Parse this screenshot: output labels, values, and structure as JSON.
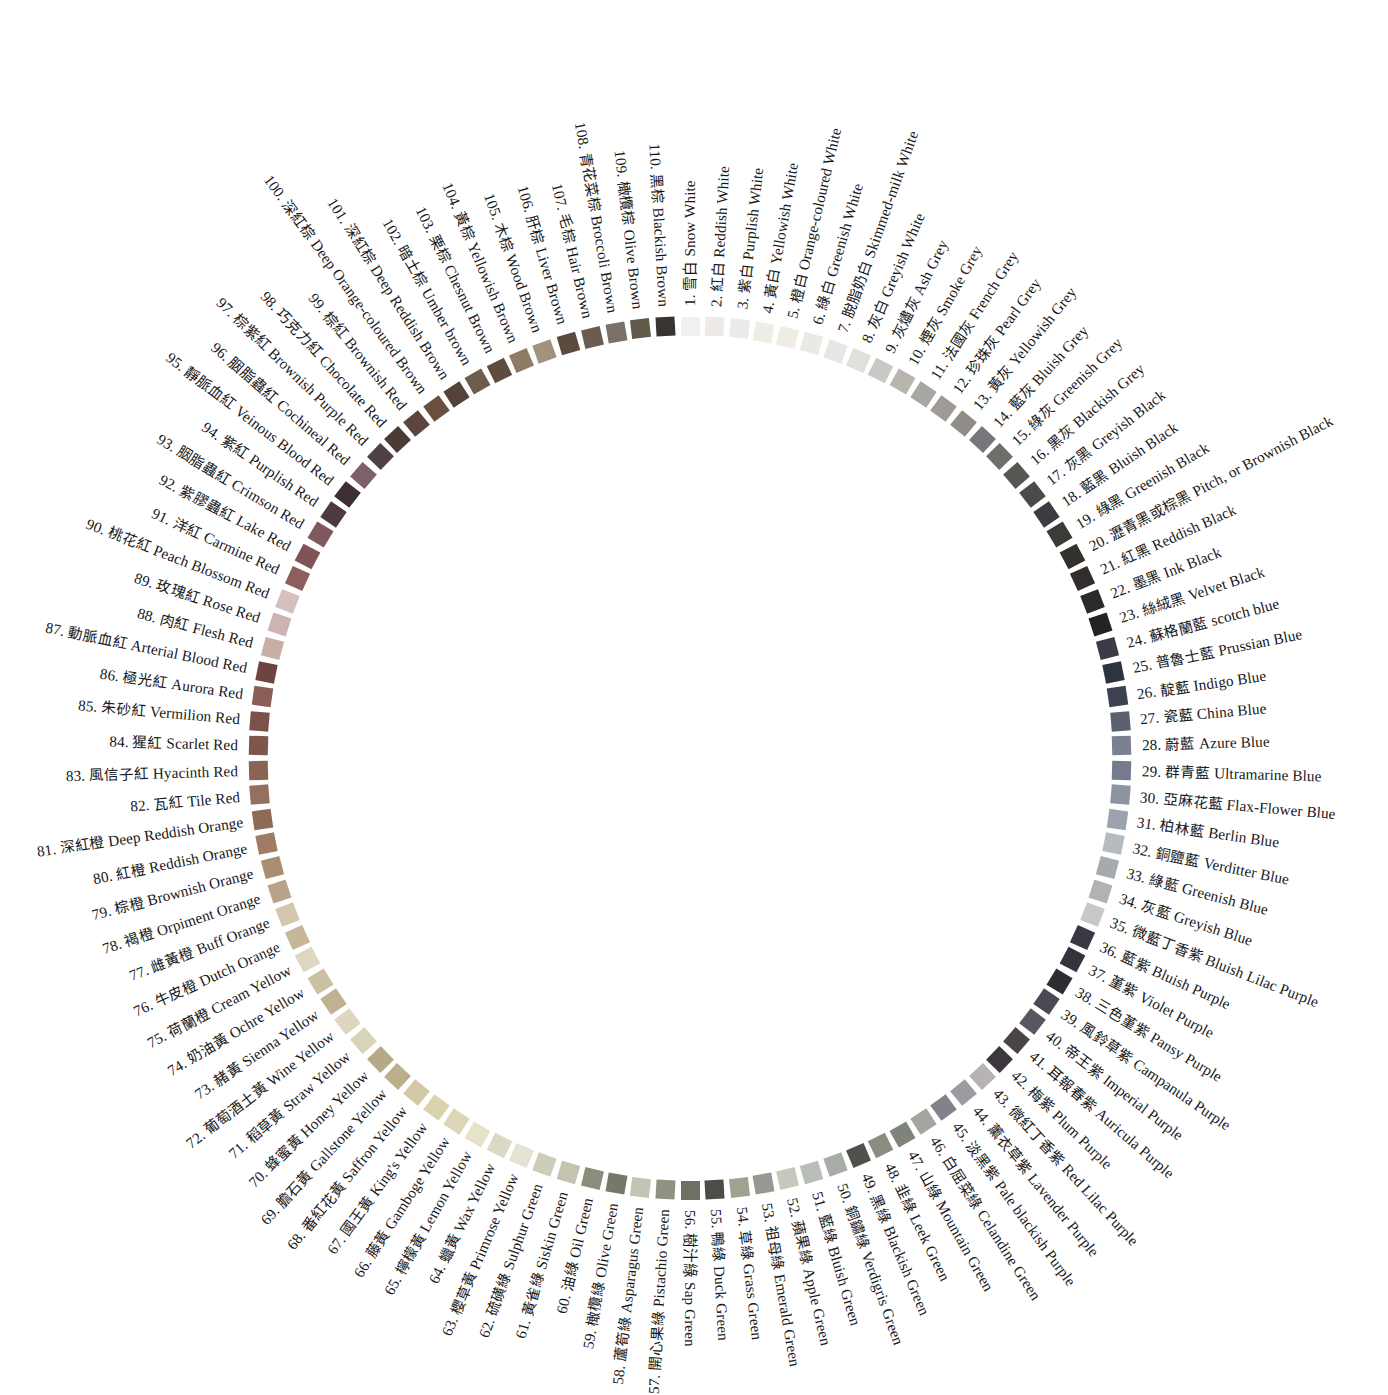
{
  "figure": {
    "swatch_count": 110,
    "center": {
      "x": 690,
      "y": 758
    },
    "swatch_radius": 432,
    "label_radius": 452,
    "start_angle_deg": -90,
    "angle_step_deg": 3.2727,
    "background": "#ffffff",
    "text_color": "#18181a"
  },
  "entries": [
    {
      "n": "1.",
      "cn": "雪白",
      "en": "Snow White",
      "hex": "#f2f1ef"
    },
    {
      "n": "2.",
      "cn": "紅白",
      "en": "Reddish White",
      "hex": "#eeeae8"
    },
    {
      "n": "3.",
      "cn": "紫白",
      "en": "Purplish White",
      "hex": "#eceaea"
    },
    {
      "n": "4.",
      "cn": "黃白",
      "en": "Yellowish White",
      "hex": "#efeee6"
    },
    {
      "n": "5.",
      "cn": "橙白",
      "en": "Orange-coloured White",
      "hex": "#efece4"
    },
    {
      "n": "6.",
      "cn": "綠白",
      "en": "Greenish White",
      "hex": "#eaeae4"
    },
    {
      "n": "7.",
      "cn": "脫脂奶白",
      "en": "Skimmed-milk White",
      "hex": "#e7e7e3"
    },
    {
      "n": "8.",
      "cn": "灰白",
      "en": "Greyish White",
      "hex": "#e0dfda"
    },
    {
      "n": "9.",
      "cn": "灰燼灰",
      "en": "Ash Grey",
      "hex": "#c9c8c4"
    },
    {
      "n": "10.",
      "cn": "煙灰",
      "en": "Smoke Grey",
      "hex": "#b7b5ae"
    },
    {
      "n": "11.",
      "cn": "法國灰",
      "en": "French Grey",
      "hex": "#a9a7a3"
    },
    {
      "n": "12.",
      "cn": "珍珠灰",
      "en": "Pearl Grey",
      "hex": "#9d9a98"
    },
    {
      "n": "13.",
      "cn": "黃灰",
      "en": "Yellowish Grey",
      "hex": "#908d86"
    },
    {
      "n": "14.",
      "cn": "藍灰",
      "en": "Bluish Grey",
      "hex": "#77767a"
    },
    {
      "n": "15.",
      "cn": "綠灰",
      "en": "Greenish Grey",
      "hex": "#6e6f69"
    },
    {
      "n": "16.",
      "cn": "黑灰",
      "en": "Blackish Grey",
      "hex": "#565653"
    },
    {
      "n": "17.",
      "cn": "灰黑",
      "en": "Greyish Black",
      "hex": "#4a4a49"
    },
    {
      "n": "18.",
      "cn": "藍黑",
      "en": "Bluish Black",
      "hex": "#3b3c41"
    },
    {
      "n": "19.",
      "cn": "綠黑",
      "en": "Greenish Black",
      "hex": "#3a3c38"
    },
    {
      "n": "20.",
      "cn": "瀝青黑或棕黑",
      "en": "Pitch, or Brownish Black",
      "hex": "#34302c"
    },
    {
      "n": "21.",
      "cn": "紅黑",
      "en": "Reddish Black",
      "hex": "#342d2e"
    },
    {
      "n": "22.",
      "cn": "墨黑",
      "en": "Ink Black",
      "hex": "#2b2b2e"
    },
    {
      "n": "23.",
      "cn": "絲絨黑",
      "en": "Velvet Black",
      "hex": "#232325"
    },
    {
      "n": "24.",
      "cn": "蘇格蘭藍",
      "en": "scotch blue",
      "hex": "#3a3b47"
    },
    {
      "n": "25.",
      "cn": "普魯士藍",
      "en": "Prussian Blue",
      "hex": "#2e3342"
    },
    {
      "n": "26.",
      "cn": "靛藍",
      "en": "Indigo Blue",
      "hex": "#3e4250"
    },
    {
      "n": "27.",
      "cn": "瓷藍",
      "en": "China Blue",
      "hex": "#5c6171"
    },
    {
      "n": "28.",
      "cn": "蔚藍",
      "en": "Azure Blue",
      "hex": "#7b8191"
    },
    {
      "n": "29.",
      "cn": "群青藍",
      "en": "Ultramarine Blue",
      "hex": "#757b8c"
    },
    {
      "n": "30.",
      "cn": "亞麻花藍",
      "en": "Flax-Flower Blue",
      "hex": "#8d93a1"
    },
    {
      "n": "31.",
      "cn": "柏林藍",
      "en": "Berlin Blue",
      "hex": "#9da3ae"
    },
    {
      "n": "32.",
      "cn": "銅鹽藍",
      "en": "Verditter Blue",
      "hex": "#b6bbc1"
    },
    {
      "n": "33.",
      "cn": "綠藍",
      "en": "Greenish Blue",
      "hex": "#a5aaae"
    },
    {
      "n": "34.",
      "cn": "灰藍",
      "en": "Greyish Blue",
      "hex": "#b0b2b3"
    },
    {
      "n": "35.",
      "cn": "微藍丁香紫",
      "en": "Bluish Lilac Purple",
      "hex": "#c9c8c8"
    },
    {
      "n": "36.",
      "cn": "藍紫",
      "en": "Bluish Purple",
      "hex": "#393742"
    },
    {
      "n": "37.",
      "cn": "堇紫",
      "en": "Violet Purple",
      "hex": "#35333c"
    },
    {
      "n": "38.",
      "cn": "三色堇紫",
      "en": "Pansy Purple",
      "hex": "#2f2c32"
    },
    {
      "n": "39.",
      "cn": "風鈴草紫",
      "en": "Campanula Purple",
      "hex": "#4c4956"
    },
    {
      "n": "40.",
      "cn": "帝王紫",
      "en": "Imperial Purple",
      "hex": "#5a5660"
    },
    {
      "n": "41.",
      "cn": "耳報春紫",
      "en": "Auricula Purple",
      "hex": "#4a4447"
    },
    {
      "n": "42.",
      "cn": "梅紫",
      "en": "Plum Purple",
      "hex": "#3c373c"
    },
    {
      "n": "43.",
      "cn": "微紅丁香紫",
      "en": "Red Lilac Purple",
      "hex": "#b8b2b5"
    },
    {
      "n": "44.",
      "cn": "薰衣草紫",
      "en": "Lavender Purple",
      "hex": "#9d9aa0"
    },
    {
      "n": "45.",
      "cn": "淡黑紫",
      "en": "Pale blackish Purple",
      "hex": "#84818a"
    },
    {
      "n": "46.",
      "cn": "白屈菜綠",
      "en": "Celandine Green",
      "hex": "#a3a69f"
    },
    {
      "n": "47.",
      "cn": "山綠",
      "en": "Mountain Green",
      "hex": "#7e847c"
    },
    {
      "n": "48.",
      "cn": "韭綠",
      "en": "Leek Green",
      "hex": "#8a8d80"
    },
    {
      "n": "49.",
      "cn": "黑綠",
      "en": "Blackish Green",
      "hex": "#4e524b"
    },
    {
      "n": "50.",
      "cn": "銅鏽綠",
      "en": "Verdigris Green",
      "hex": "#a6aca6"
    },
    {
      "n": "51.",
      "cn": "藍綠",
      "en": "Bluish Green",
      "hex": "#b9bdb8"
    },
    {
      "n": "52.",
      "cn": "蘋果綠",
      "en": "Apple Green",
      "hex": "#c6c8bb"
    },
    {
      "n": "53.",
      "cn": "祖母綠",
      "en": "Emerald Green",
      "hex": "#949a92"
    },
    {
      "n": "54.",
      "cn": "草綠",
      "en": "Grass Green",
      "hex": "#9fa291"
    },
    {
      "n": "55.",
      "cn": "鴨綠",
      "en": "Duck Green",
      "hex": "#4b4e46"
    },
    {
      "n": "56.",
      "cn": "樹汁綠",
      "en": "Sap Green",
      "hex": "#6e7064"
    },
    {
      "n": "57.",
      "cn": "開心果綠",
      "en": "Pistachio Green",
      "hex": "#8f9280"
    },
    {
      "n": "58.",
      "cn": "蘆筍綠",
      "en": "Asparagus Green",
      "hex": "#c3c4b3"
    },
    {
      "n": "59.",
      "cn": "橄欖綠",
      "en": "Olive Green",
      "hex": "#76786a"
    },
    {
      "n": "60.",
      "cn": "油綠",
      "en": "Oil Green",
      "hex": "#8b8d7a"
    },
    {
      "n": "61.",
      "cn": "黃雀綠",
      "en": "Siskin Green",
      "hex": "#c3c3ae"
    },
    {
      "n": "62.",
      "cn": "硫磺綠",
      "en": "Sulphur Green",
      "hex": "#cdcdb9"
    },
    {
      "n": "63.",
      "cn": "櫻草黃",
      "en": "Primrose Yellow",
      "hex": "#e5e2d3"
    },
    {
      "n": "64.",
      "cn": "蠟黃",
      "en": "Wax Yellow",
      "hex": "#dcd8c3"
    },
    {
      "n": "65.",
      "cn": "檸檬黃",
      "en": "Lemon Yellow",
      "hex": "#e7e3c8"
    },
    {
      "n": "66.",
      "cn": "藤黃",
      "en": "Gamboge Yellow",
      "hex": "#dcd5b6"
    },
    {
      "n": "67.",
      "cn": "國王黃",
      "en": "King's Yellow",
      "hex": "#dbd3ad"
    },
    {
      "n": "68.",
      "cn": "番紅花黃",
      "en": "Saffron Yellow",
      "hex": "#d4c9a5"
    },
    {
      "n": "69.",
      "cn": "膽石黃",
      "en": "Gallstone Yellow",
      "hex": "#bcae88"
    },
    {
      "n": "70.",
      "cn": "蜂蜜黃",
      "en": "Honey Yellow",
      "hex": "#b6aa86"
    },
    {
      "n": "71.",
      "cn": "稻草黃",
      "en": "Straw Yellow",
      "hex": "#d9d3b8"
    },
    {
      "n": "72.",
      "cn": "葡萄酒土黃",
      "en": "Wine Yellow",
      "hex": "#ded7be"
    },
    {
      "n": "73.",
      "cn": "赭黃",
      "en": "Sienna Yellow",
      "hex": "#bfb192"
    },
    {
      "n": "74.",
      "cn": "奶油黃",
      "en": "Ochre Yellow",
      "hex": "#cbc1a1"
    },
    {
      "n": "75.",
      "cn": "荷蘭橙",
      "en": "Cream Yellow",
      "hex": "#ded7c2"
    },
    {
      "n": "76.",
      "cn": "牛皮橙",
      "en": "Dutch Orange",
      "hex": "#c8b698"
    },
    {
      "n": "77.",
      "cn": "雌黃橙",
      "en": "Buff Orange",
      "hex": "#d3c7ad"
    },
    {
      "n": "78.",
      "cn": "褐橙",
      "en": "Orpiment Orange",
      "hex": "#b9a287"
    },
    {
      "n": "79.",
      "cn": "棕橙",
      "en": "Brownish Orange",
      "hex": "#a98e72"
    },
    {
      "n": "80.",
      "cn": "紅橙",
      "en": "Reddish Orange",
      "hex": "#a07c64"
    },
    {
      "n": "81.",
      "cn": "深紅橙",
      "en": "Deep Reddish Orange",
      "hex": "#8f6a55"
    },
    {
      "n": "82.",
      "cn": "瓦紅",
      "en": "Tile Red",
      "hex": "#96705f"
    },
    {
      "n": "83.",
      "cn": "風信子紅",
      "en": "Hyacinth Red",
      "hex": "#8a6354"
    },
    {
      "n": "84.",
      "cn": "猩紅",
      "en": "Scarlet Red",
      "hex": "#7d564c"
    },
    {
      "n": "85.",
      "cn": "朱砂紅",
      "en": "Vermilion Red",
      "hex": "#7b5249"
    },
    {
      "n": "86.",
      "cn": "極光紅",
      "en": "Aurora Red",
      "hex": "#8a5f55"
    },
    {
      "n": "87.",
      "cn": "動脈血紅",
      "en": "Arterial Blood Red",
      "hex": "#6f4440"
    },
    {
      "n": "88.",
      "cn": "肉紅",
      "en": "Flesh Red",
      "hex": "#c8aea4"
    },
    {
      "n": "89.",
      "cn": "玫瑰紅",
      "en": "Rose Red",
      "hex": "#cbb4b2"
    },
    {
      "n": "90.",
      "cn": "桃花紅",
      "en": "Peach Blossom Red",
      "hex": "#d4c1bd"
    },
    {
      "n": "91.",
      "cn": "洋紅",
      "en": "Carmine Red",
      "hex": "#8e5d5e"
    },
    {
      "n": "92.",
      "cn": "紫膠蟲紅",
      "en": "Lake Red",
      "hex": "#7e5458"
    },
    {
      "n": "93.",
      "cn": "胭脂蟲紅",
      "en": "Crimson Red",
      "hex": "#7f575e"
    },
    {
      "n": "94.",
      "cn": "紫紅",
      "en": "Purplish Red",
      "hex": "#4e3842"
    },
    {
      "n": "95.",
      "cn": "靜脈血紅",
      "en": "Veinous Blood Red",
      "hex": "#3e2f34"
    },
    {
      "n": "96.",
      "cn": "胭脂蟲紅",
      "en": "Cochineal Red",
      "hex": "#7e6168"
    },
    {
      "n": "97.",
      "cn": "棕紫紅",
      "en": "Brownish Purple Red",
      "hex": "#4f3f46"
    },
    {
      "n": "98.",
      "cn": "巧克力紅",
      "en": "Chocolate Red",
      "hex": "#4b3a36"
    },
    {
      "n": "99.",
      "cn": "棕紅",
      "en": "Brownish Red",
      "hex": "#5c453c"
    },
    {
      "n": "100.",
      "cn": "深紅棕",
      "en": "Deep Orange-coloured Brown",
      "hex": "#6a4f3f"
    },
    {
      "n": "101.",
      "cn": "深紅棕",
      "en": "Deep Reddish Brown",
      "hex": "#56403a"
    },
    {
      "n": "102.",
      "cn": "暗土棕",
      "en": "Umber brown",
      "hex": "#6e5c4d"
    },
    {
      "n": "103.",
      "cn": "栗棕",
      "en": "Chesnut Brown",
      "hex": "#5f4c41"
    },
    {
      "n": "104.",
      "cn": "黃棕",
      "en": "Yellowish Brown",
      "hex": "#8d7b64"
    },
    {
      "n": "105.",
      "cn": "木棕",
      "en": "Wood Brown",
      "hex": "#a2927c"
    },
    {
      "n": "106.",
      "cn": "肝棕",
      "en": "Liver Brown",
      "hex": "#5a4a40"
    },
    {
      "n": "107.",
      "cn": "毛棕",
      "en": "Hair Brown",
      "hex": "#6a5c50"
    },
    {
      "n": "108.",
      "cn": "青花菜棕",
      "en": "Broccoli Brown",
      "hex": "#7c7167"
    },
    {
      "n": "109.",
      "cn": "橄欖棕",
      "en": "Olive Brown",
      "hex": "#615a4b"
    },
    {
      "n": "110.",
      "cn": "黑棕",
      "en": "Blackish Brown",
      "hex": "#393430"
    }
  ]
}
